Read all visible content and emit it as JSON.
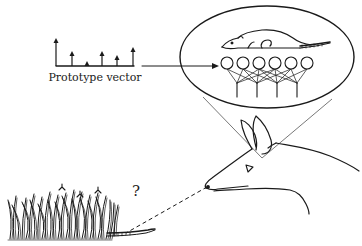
{
  "figure": {
    "ink_color": "#1a1a1a",
    "background": "#ffffff"
  },
  "prototype_vector": {
    "label": "Prototype vector",
    "arrows": [
      {
        "x": 56,
        "height": 28
      },
      {
        "x": 72,
        "height": 15
      },
      {
        "x": 87,
        "height": 5
      },
      {
        "x": 102,
        "height": 15
      },
      {
        "x": 117,
        "height": 11
      },
      {
        "x": 133,
        "height": 19
      }
    ],
    "baseline_y": 66
  },
  "thought_bubble": {
    "content": "rat",
    "network": {
      "input_nodes": 6,
      "output_stems": 4
    }
  },
  "scene": {
    "question_mark": "?",
    "elements": [
      "grass",
      "rat-tail",
      "fox-head",
      "line-of-sight"
    ]
  }
}
